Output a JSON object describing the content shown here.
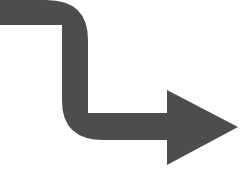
{
  "canvas": {
    "width": 245,
    "height": 186,
    "background_color": "#ffffff",
    "alt_text": "S-curved right-pointing arrow"
  },
  "graphic": {
    "name": "curved-right-arrow",
    "description": "A thick dark gray arrow that enters from the left edge, bends downward, bends right again, and terminates in a large rightward-pointing triangular arrowhead",
    "fill_color": "#4d4d4d",
    "stroke_color": "none",
    "direction": "right",
    "style": "solid",
    "shaft_thickness": 26,
    "path": "M 0 0 L 46 0 Q 88 0 88 40 L 88 113 L 167 113 L 167 90 L 238 127 L 167 165 L 167 140 L 104 140 Q 62 140 62 101 L 62 25 L 0 25 Z",
    "segments": [
      {
        "name": "top-horizontal-shaft",
        "x1": 0,
        "y1": 0,
        "x2": 62,
        "y2": 25
      },
      {
        "name": "upper-bend",
        "corner": "top-right",
        "radius": 40
      },
      {
        "name": "vertical-shaft",
        "x1": 62,
        "y1": 25,
        "x2": 88,
        "y2": 113
      },
      {
        "name": "lower-bend",
        "corner": "bottom-left",
        "radius": 39
      },
      {
        "name": "bottom-horizontal-shaft",
        "x1": 88,
        "y1": 113,
        "x2": 167,
        "y2": 140
      },
      {
        "name": "arrowhead",
        "back_top": [
          167,
          90
        ],
        "back_bottom": [
          167,
          165
        ],
        "tip": [
          238,
          127
        ]
      }
    ]
  }
}
